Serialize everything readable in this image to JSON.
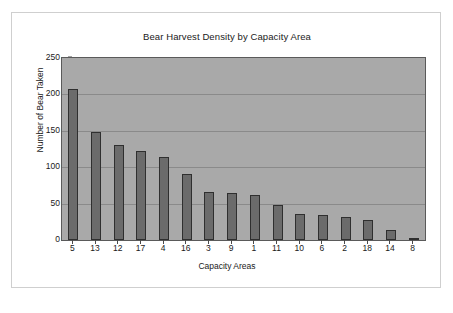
{
  "chart_data": {
    "type": "bar",
    "title": "Bear Harvest Density by Capacity Area",
    "xlabel": "Capacity Areas",
    "ylabel": "Number of Bear Taken",
    "categories": [
      "5",
      "13",
      "12",
      "17",
      "4",
      "16",
      "3",
      "9",
      "1",
      "11",
      "10",
      "6",
      "2",
      "18",
      "14",
      "8"
    ],
    "values": [
      207,
      149,
      131,
      122,
      114,
      90,
      66,
      65,
      62,
      48,
      36,
      35,
      31,
      28,
      14,
      1
    ],
    "ylim": [
      0,
      250
    ],
    "yticks": [
      250,
      200,
      150,
      100,
      50,
      0
    ],
    "grid": true,
    "legend": false,
    "colors": {
      "bar_fill": "#6b6b6b",
      "bar_outline": "#2f2f2f",
      "plot_background": "#a9a9a9",
      "gridline": "#8a8a8a",
      "axis": "#5a5a5a",
      "text": "#1a1a1a",
      "page_background": "#ffffff",
      "frame_border": "#cfcfcf"
    }
  }
}
